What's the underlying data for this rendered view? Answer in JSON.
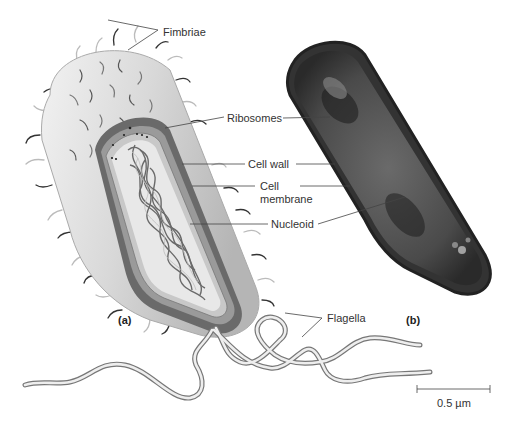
{
  "figure": {
    "panels": [
      {
        "id": "a",
        "label": "(a)",
        "description": "Illustration of rod-shaped bacterium, cut away"
      },
      {
        "id": "b",
        "label": "(b)",
        "description": "Electron micrograph of bacterium"
      }
    ],
    "labels": {
      "fimbriae": "Fimbriae",
      "ribosomes": "Ribosomes",
      "cell_wall": "Cell wall",
      "cell_membrane_1": "Cell",
      "cell_membrane_2": "membrane",
      "nucleoid": "Nucleoid",
      "flagella": "Flagella"
    },
    "scale_bar": {
      "label": "0.5 µm"
    },
    "colors": {
      "cell_surface": "#d9d9d9",
      "cell_wall": "#5a5a5a",
      "cytoplasm": "#e6e6e6",
      "nucleoid": "#6e6e6e",
      "micrograph": "#3a3a3a",
      "line": "#444444"
    }
  }
}
